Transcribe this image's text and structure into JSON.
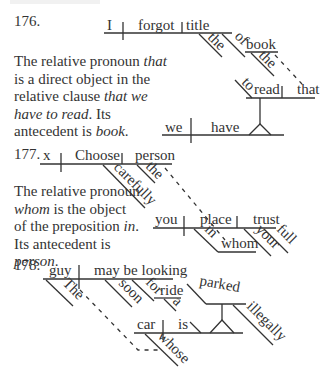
{
  "exercises": [
    {
      "number": "176.",
      "note": {
        "parts": [
          "The relative pronoun ",
          "that",
          " is a direct object in the relative clause ",
          "that we have to read",
          ". Its antecedent is ",
          "book",
          "."
        ]
      },
      "words": {
        "subject": "I",
        "verb": "forgot",
        "object": "title",
        "mod_the1": "the",
        "prep": "of",
        "prep_obj": "book",
        "mod_the2": "the",
        "inf_to": "to",
        "inf_verb": "read",
        "rel_pronoun": "that",
        "clause_subject": "we",
        "clause_verb": "have"
      }
    },
    {
      "number": "177.",
      "note": {
        "parts": [
          "The relative pronoun ",
          "whom",
          " is the object of the preposition ",
          "in",
          ". Its antecedent is ",
          "person",
          "."
        ]
      },
      "words": {
        "subject": "x",
        "verb": "Choose",
        "object": "person",
        "adverb": "carefully",
        "mod_the": "the",
        "clause_subject": "you",
        "clause_verb": "place",
        "clause_object": "trust",
        "prep": "in",
        "prep_obj": "whom",
        "mod_your": "your",
        "mod_full": "full"
      }
    },
    {
      "number": "178.",
      "words": {
        "subject": "guy",
        "verb": "may be looking",
        "mod_the": "The",
        "adverb": "soon",
        "prep": "for",
        "prep_obj": "ride",
        "mod_a": "a",
        "clause_subject": "car",
        "clause_verb": "is",
        "mod_whose": "whose",
        "participle": "parked",
        "adverb2": "illegally"
      }
    }
  ]
}
